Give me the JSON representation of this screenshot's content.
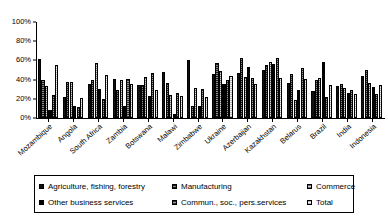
{
  "chart_data": {
    "type": "bar",
    "title": "",
    "xlabel": "",
    "ylabel": "",
    "ylim": [
      0,
      100
    ],
    "grid": false,
    "legend_position": "bottom",
    "y_ticks": [
      "0%",
      "20%",
      "40%",
      "60%",
      "80%",
      "100%"
    ],
    "y_tick_values": [
      0,
      20,
      40,
      60,
      80,
      100
    ],
    "categories": [
      "Mozambique",
      "Angola",
      "South Africa",
      "Zambia",
      "Botswana",
      "Malawi",
      "Zimbabwe",
      "Ukraine",
      "Azerbaijan",
      "Kazakhstan",
      "Belarus",
      "Brazil",
      "India",
      "Indonesia"
    ],
    "series": [
      {
        "name": "Agriculture, fishing, forestry",
        "values": [
          61,
          22,
          35,
          41,
          34,
          48,
          60,
          46,
          47,
          50,
          36,
          28,
          33,
          44
        ]
      },
      {
        "name": "Manufacturing",
        "values": [
          40,
          38,
          40,
          29,
          34,
          36,
          12,
          57,
          63,
          55,
          46,
          40,
          35,
          50
        ]
      },
      {
        "name": "Commerce",
        "values": [
          33,
          37,
          57,
          40,
          43,
          24,
          31,
          49,
          43,
          58,
          19,
          42,
          31,
          36
        ]
      },
      {
        "name": "Other business services",
        "values": [
          8,
          12,
          30,
          12,
          23,
          4,
          13,
          35,
          53,
          56,
          29,
          58,
          26,
          32
        ]
      },
      {
        "name": "Commun., soc., pers.services",
        "values": [
          24,
          11,
          20,
          41,
          47,
          26,
          30,
          40,
          42,
          63,
          52,
          22,
          29,
          25
        ]
      },
      {
        "name": "Total",
        "values": [
          55,
          21,
          45,
          35,
          29,
          23,
          22,
          44,
          35,
          42,
          41,
          34,
          25,
          34
        ]
      }
    ]
  },
  "legend": {
    "items": [
      {
        "label": "Agriculture, fishing, forestry",
        "series": 0
      },
      {
        "label": "Manufacturing",
        "series": 1
      },
      {
        "label": "Commerce",
        "series": 2
      },
      {
        "label": "Other business services",
        "series": 3
      },
      {
        "label": "Commun., soc., pers.services",
        "series": 4
      },
      {
        "label": "Total",
        "series": 5
      }
    ]
  },
  "colors": {
    "axis": "#000000",
    "background": "#ffffff",
    "text": "#000000"
  }
}
